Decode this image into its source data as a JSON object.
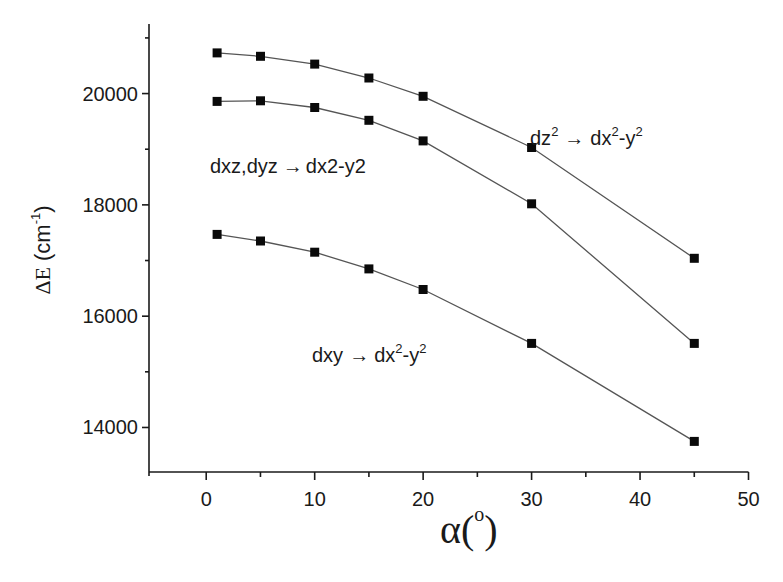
{
  "chart_data": {
    "type": "line",
    "title": "",
    "xlabel": "α(°)",
    "xlabel_main": "α(",
    "xlabel_sup": "o",
    "xlabel_close": ")",
    "ylabel": "ΔE (cm⁻¹)",
    "ylabel_main": "ΔE",
    "ylabel_unit": "(cm",
    "ylabel_sup": "-1",
    "ylabel_close": ")",
    "xlim": [
      -5,
      50
    ],
    "ylim": [
      13200,
      21250
    ],
    "xticks": [
      0,
      10,
      20,
      30,
      40,
      50
    ],
    "xticks_minor": [
      5,
      15,
      25,
      35,
      45
    ],
    "yticks": [
      14000,
      16000,
      18000,
      20000
    ],
    "yticks_minor": [
      15000,
      17000,
      19000,
      21000
    ],
    "xtick_labels": [
      "0",
      "10",
      "20",
      "30",
      "40",
      "50"
    ],
    "ytick_labels": [
      "14000",
      "16000",
      "18000",
      "20000"
    ],
    "grid": false,
    "legend": "none",
    "x": [
      1,
      5,
      10,
      15,
      20,
      30,
      45
    ],
    "series": [
      {
        "name": "dz² → dx²-y²",
        "values": [
          20730,
          20670,
          20530,
          20280,
          19950,
          19030,
          17040
        ]
      },
      {
        "name": "dxz,dyz → dx2-y2",
        "values": [
          19860,
          19870,
          19750,
          19520,
          19150,
          18020,
          15510
        ]
      },
      {
        "name": "dxy → dx²-y²",
        "values": [
          17470,
          17350,
          17150,
          16850,
          16480,
          15510,
          13750
        ]
      }
    ],
    "annotations": [
      {
        "series": 0,
        "parts": [
          {
            "text": "dz",
            "sup": "2"
          },
          {
            "text": " → ",
            "arrow": true
          },
          {
            "text": "dx",
            "sup": "2"
          },
          {
            "text": "-y",
            "sup": "2"
          }
        ],
        "plain": "dz² → dx²-y²"
      },
      {
        "series": 1,
        "parts": [
          {
            "text": "dxz,dyz"
          },
          {
            "text": " → ",
            "arrow": true
          },
          {
            "text": "dx2-y2"
          }
        ],
        "plain": "dxz,dyz → dx2-y2"
      },
      {
        "series": 2,
        "parts": [
          {
            "text": "dxy"
          },
          {
            "text": " → ",
            "arrow": true
          },
          {
            "text": "dx",
            "sup": "2"
          },
          {
            "text": "-y",
            "sup": "2"
          }
        ],
        "plain": "dxy → dx²-y²"
      }
    ]
  }
}
